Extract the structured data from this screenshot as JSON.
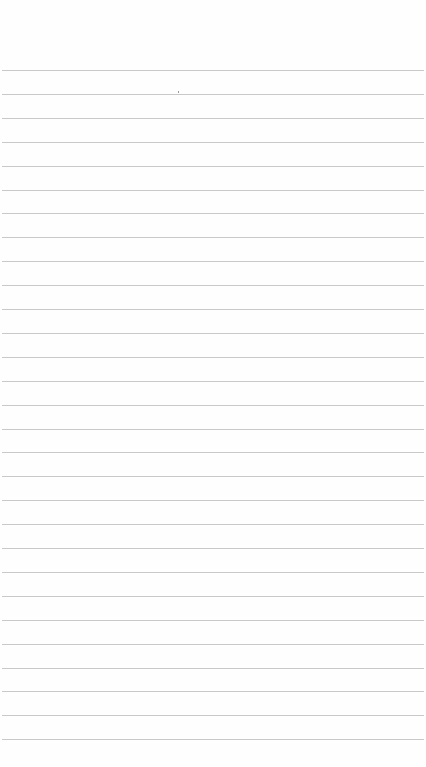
{
  "page": {
    "type": "lined-notepad",
    "content": "",
    "background_color": "#fefefe",
    "rule_color": "#c9c9c9",
    "rule_count": 29,
    "first_rule_y": 70,
    "rule_spacing": 23.9
  }
}
